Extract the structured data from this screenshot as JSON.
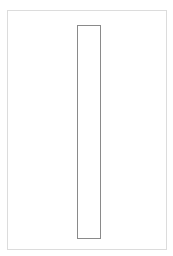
{
  "canvas": {
    "width": 173,
    "height": 256,
    "background": "#ffffff"
  },
  "frame": {
    "border_color": "#dcdcdc"
  },
  "inner_rectangle": {
    "border_color": "#8a8a8a",
    "fill": "#ffffff"
  }
}
